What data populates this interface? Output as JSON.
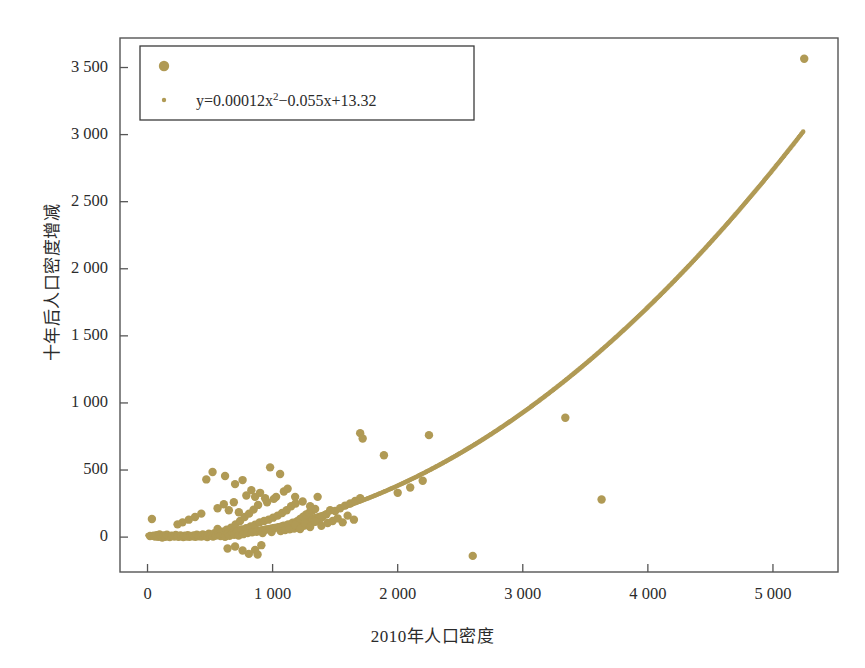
{
  "chart_data": {
    "type": "scatter",
    "title": "",
    "xlabel": "2010年人口密度",
    "ylabel": "十年后人口密度增减",
    "xlim": [
      -220,
      5520
    ],
    "ylim": [
      -260,
      3720
    ],
    "grid": false,
    "legend_position": "top-left",
    "marker_color": "#b09a55",
    "curve_color": "#b09a55",
    "frame_color": "#555555",
    "xticks": [
      0,
      1000,
      2000,
      3000,
      4000,
      5000
    ],
    "xtick_labels": [
      "0",
      "1 000",
      "2 000",
      "3 000",
      "4 000",
      "5 000"
    ],
    "yticks": [
      0,
      500,
      1000,
      1500,
      2000,
      2500,
      3000,
      3500
    ],
    "ytick_labels": [
      "0",
      "500",
      "1 000",
      "1 500",
      "2 000",
      "2 500",
      "3 000",
      "3 500"
    ],
    "legend": [
      {
        "marker": "large-dot",
        "label": ""
      },
      {
        "marker": "small-dot",
        "label": "y=0.00012x²−0.055x+13.32"
      }
    ],
    "equation": {
      "text": "y=0.00012x²−0.055x+13.32",
      "a": 0.00012,
      "b": -0.055,
      "c": 13.32,
      "x_from": 0,
      "x_to": 5250
    },
    "series": [
      {
        "name": "观测点",
        "type": "scatter",
        "color": "#b09a55",
        "points": [
          [
            20,
            8
          ],
          [
            35,
            135
          ],
          [
            48,
            10
          ],
          [
            60,
            5
          ],
          [
            72,
            14
          ],
          [
            85,
            2
          ],
          [
            96,
            20
          ],
          [
            108,
            6
          ],
          [
            118,
            -4
          ],
          [
            130,
            12
          ],
          [
            142,
            3
          ],
          [
            155,
            18
          ],
          [
            168,
            7
          ],
          [
            178,
            1
          ],
          [
            190,
            11
          ],
          [
            202,
            9
          ],
          [
            214,
            4
          ],
          [
            226,
            16
          ],
          [
            238,
            6
          ],
          [
            250,
            2
          ],
          [
            262,
            13
          ],
          [
            274,
            8
          ],
          [
            286,
            0
          ],
          [
            298,
            10
          ],
          [
            310,
            5
          ],
          [
            322,
            15
          ],
          [
            334,
            3
          ],
          [
            346,
            9
          ],
          [
            358,
            7
          ],
          [
            370,
            12
          ],
          [
            382,
            2
          ],
          [
            394,
            18
          ],
          [
            406,
            6
          ],
          [
            418,
            11
          ],
          [
            430,
            4
          ],
          [
            442,
            20
          ],
          [
            454,
            8
          ],
          [
            466,
            14
          ],
          [
            478,
            1
          ],
          [
            490,
            25
          ],
          [
            500,
            9
          ],
          [
            512,
            16
          ],
          [
            524,
            5
          ],
          [
            536,
            30
          ],
          [
            548,
            12
          ],
          [
            560,
            60
          ],
          [
            572,
            22
          ],
          [
            584,
            8
          ],
          [
            596,
            40
          ],
          [
            608,
            15
          ],
          [
            620,
            3
          ],
          [
            632,
            55
          ],
          [
            644,
            26
          ],
          [
            656,
            10
          ],
          [
            668,
            70
          ],
          [
            680,
            33
          ],
          [
            692,
            18
          ],
          [
            704,
            95
          ],
          [
            716,
            44
          ],
          [
            728,
            12
          ],
          [
            740,
            120
          ],
          [
            752,
            58
          ],
          [
            764,
            22
          ],
          [
            776,
            150
          ],
          [
            788,
            66
          ],
          [
            800,
            30
          ],
          [
            812,
            175
          ],
          [
            824,
            80
          ],
          [
            836,
            36
          ],
          [
            848,
            205
          ],
          [
            860,
            92
          ],
          [
            872,
            40
          ],
          [
            884,
            240
          ],
          [
            896,
            110
          ],
          [
            908,
            48
          ],
          [
            920,
            30
          ],
          [
            932,
            120
          ],
          [
            944,
            55
          ],
          [
            956,
            260
          ],
          [
            968,
            130
          ],
          [
            980,
            60
          ],
          [
            992,
            38
          ],
          [
            1004,
            145
          ],
          [
            1016,
            68
          ],
          [
            1028,
            300
          ],
          [
            1040,
            160
          ],
          [
            1052,
            72
          ],
          [
            1064,
            45
          ],
          [
            1076,
            180
          ],
          [
            1088,
            85
          ],
          [
            1100,
            52
          ],
          [
            1112,
            200
          ],
          [
            1124,
            95
          ],
          [
            1136,
            58
          ],
          [
            1148,
            230
          ],
          [
            1160,
            108
          ],
          [
            1172,
            64
          ],
          [
            1184,
            250
          ],
          [
            1196,
            118
          ],
          [
            1208,
            70
          ],
          [
            1220,
            135
          ],
          [
            1232,
            78
          ],
          [
            1244,
            152
          ],
          [
            1256,
            86
          ],
          [
            1268,
            168
          ],
          [
            1280,
            94
          ],
          [
            1292,
            182
          ],
          [
            1304,
            104
          ],
          [
            1316,
            196
          ],
          [
            1328,
            112
          ],
          [
            1340,
            210
          ],
          [
            1352,
            122
          ],
          [
            1364,
            128
          ],
          [
            1376,
            136
          ],
          [
            1388,
            144
          ],
          [
            1400,
            152
          ],
          [
            470,
            430
          ],
          [
            520,
            485
          ],
          [
            620,
            455
          ],
          [
            700,
            395
          ],
          [
            760,
            425
          ],
          [
            790,
            310
          ],
          [
            830,
            350
          ],
          [
            860,
            300
          ],
          [
            900,
            330
          ],
          [
            940,
            290
          ],
          [
            980,
            520
          ],
          [
            1010,
            285
          ],
          [
            1060,
            470
          ],
          [
            1090,
            340
          ],
          [
            1120,
            360
          ],
          [
            1180,
            300
          ],
          [
            1240,
            265
          ],
          [
            1300,
            230
          ],
          [
            1360,
            300
          ],
          [
            560,
            215
          ],
          [
            610,
            245
          ],
          [
            650,
            200
          ],
          [
            690,
            260
          ],
          [
            730,
            185
          ],
          [
            430,
            175
          ],
          [
            380,
            150
          ],
          [
            330,
            130
          ],
          [
            280,
            110
          ],
          [
            240,
            95
          ],
          [
            640,
            -85
          ],
          [
            700,
            -70
          ],
          [
            760,
            -100
          ],
          [
            810,
            -125
          ],
          [
            860,
            -95
          ],
          [
            880,
            -130
          ],
          [
            910,
            -60
          ],
          [
            1430,
            170
          ],
          [
            1460,
            200
          ],
          [
            1500,
            195
          ],
          [
            1540,
            215
          ],
          [
            1580,
            235
          ],
          [
            1620,
            250
          ],
          [
            1660,
            270
          ],
          [
            1700,
            290
          ],
          [
            1700,
            775
          ],
          [
            1720,
            735
          ],
          [
            1890,
            610
          ],
          [
            2250,
            760
          ],
          [
            2600,
            -140
          ],
          [
            3340,
            890
          ],
          [
            3630,
            280
          ],
          [
            5250,
            3565
          ],
          [
            1480,
            120
          ],
          [
            1520,
            140
          ],
          [
            1560,
            110
          ],
          [
            1600,
            160
          ],
          [
            1650,
            130
          ],
          [
            1180,
            90
          ],
          [
            1220,
            60
          ],
          [
            1260,
            100
          ],
          [
            1300,
            75
          ],
          [
            1340,
            115
          ],
          [
            1390,
            85
          ],
          [
            1440,
            105
          ],
          [
            2000,
            330
          ],
          [
            2100,
            370
          ],
          [
            2200,
            420
          ]
        ]
      }
    ]
  }
}
